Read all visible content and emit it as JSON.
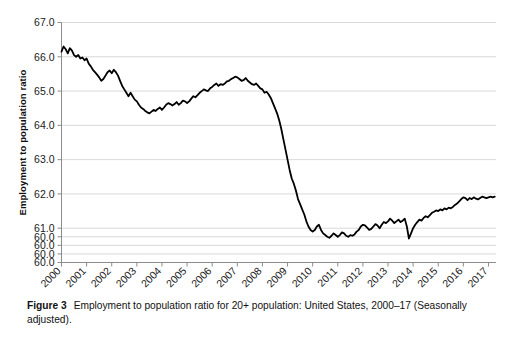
{
  "figure": {
    "caption_label": "Figure 3",
    "caption_text": "Employment to population ratio for 20+ population: United States, 2000–17 (Seasonally adjusted)."
  },
  "chart_data": {
    "type": "line",
    "title": "",
    "subtitle": "",
    "xlabel": "",
    "ylabel": "Employment to population ratio",
    "xlim": [
      2000.0,
      2017.3
    ],
    "ylim": [
      60.0,
      67.0
    ],
    "grid": true,
    "grid_axis": "y",
    "legend": false,
    "legend_position": "none",
    "line_color": "#000000",
    "line_width": 1.8,
    "grid_color": "#d9d9d9",
    "axis_color": "#8c8c8c",
    "background_color": "#ffffff",
    "y_tick_labels": [
      "67.0",
      "66.0",
      "65.0",
      "64.0",
      "63.0",
      "62.0",
      "61.0",
      "60.0",
      "60.0",
      "60.0",
      "60.0"
    ],
    "y_tick_positions": [
      67.0,
      66.0,
      65.0,
      64.0,
      63.0,
      62.0,
      61.0,
      60.75,
      60.5,
      60.25,
      60.0
    ],
    "x_tick_labels": [
      "2000",
      "2001",
      "2002",
      "2003",
      "2004",
      "2005",
      "2006",
      "2007",
      "2008",
      "2009",
      "2010",
      "2011",
      "2012",
      "2013",
      "2014",
      "2015",
      "2016",
      "2017"
    ],
    "x_tick_positions": [
      2000,
      2001,
      2002,
      2003,
      2004,
      2005,
      2006,
      2007,
      2008,
      2009,
      2010,
      2011,
      2012,
      2013,
      2014,
      2015,
      2016,
      2017
    ],
    "x_tick_rotation": -45,
    "series": [
      {
        "name": "Employment to population ratio (20+)",
        "x": [
          2000.0,
          2000.083,
          2000.167,
          2000.25,
          2000.333,
          2000.417,
          2000.5,
          2000.583,
          2000.667,
          2000.75,
          2000.833,
          2000.917,
          2001.0,
          2001.083,
          2001.167,
          2001.25,
          2001.333,
          2001.417,
          2001.5,
          2001.583,
          2001.667,
          2001.75,
          2001.833,
          2001.917,
          2002.0,
          2002.083,
          2002.167,
          2002.25,
          2002.333,
          2002.417,
          2002.5,
          2002.583,
          2002.667,
          2002.75,
          2002.833,
          2002.917,
          2003.0,
          2003.083,
          2003.167,
          2003.25,
          2003.333,
          2003.417,
          2003.5,
          2003.583,
          2003.667,
          2003.75,
          2003.833,
          2003.917,
          2004.0,
          2004.083,
          2004.167,
          2004.25,
          2004.333,
          2004.417,
          2004.5,
          2004.583,
          2004.667,
          2004.75,
          2004.833,
          2004.917,
          2005.0,
          2005.083,
          2005.167,
          2005.25,
          2005.333,
          2005.417,
          2005.5,
          2005.583,
          2005.667,
          2005.75,
          2005.833,
          2005.917,
          2006.0,
          2006.083,
          2006.167,
          2006.25,
          2006.333,
          2006.417,
          2006.5,
          2006.583,
          2006.667,
          2006.75,
          2006.833,
          2006.917,
          2007.0,
          2007.083,
          2007.167,
          2007.25,
          2007.333,
          2007.417,
          2007.5,
          2007.583,
          2007.667,
          2007.75,
          2007.833,
          2007.917,
          2008.0,
          2008.083,
          2008.167,
          2008.25,
          2008.333,
          2008.417,
          2008.5,
          2008.583,
          2008.667,
          2008.75,
          2008.833,
          2008.917,
          2009.0,
          2009.083,
          2009.167,
          2009.25,
          2009.333,
          2009.417,
          2009.5,
          2009.583,
          2009.667,
          2009.75,
          2009.833,
          2009.917,
          2010.0,
          2010.083,
          2010.167,
          2010.25,
          2010.333,
          2010.417,
          2010.5,
          2010.583,
          2010.667,
          2010.75,
          2010.833,
          2010.917,
          2011.0,
          2011.083,
          2011.167,
          2011.25,
          2011.333,
          2011.417,
          2011.5,
          2011.583,
          2011.667,
          2011.75,
          2011.833,
          2011.917,
          2012.0,
          2012.083,
          2012.167,
          2012.25,
          2012.333,
          2012.417,
          2012.5,
          2012.583,
          2012.667,
          2012.75,
          2012.833,
          2012.917,
          2013.0,
          2013.083,
          2013.167,
          2013.25,
          2013.333,
          2013.417,
          2013.5,
          2013.583,
          2013.667,
          2013.75,
          2013.833,
          2013.917,
          2014.0,
          2014.083,
          2014.167,
          2014.25,
          2014.333,
          2014.417,
          2014.5,
          2014.583,
          2014.667,
          2014.75,
          2014.833,
          2014.917,
          2015.0,
          2015.083,
          2015.167,
          2015.25,
          2015.333,
          2015.417,
          2015.5,
          2015.583,
          2015.667,
          2015.75,
          2015.833,
          2015.917,
          2016.0,
          2016.083,
          2016.167,
          2016.25,
          2016.333,
          2016.417,
          2016.5,
          2016.583,
          2016.667,
          2016.75,
          2016.833,
          2016.917,
          2017.0,
          2017.083,
          2017.167,
          2017.25
        ],
        "values": [
          66.15,
          66.3,
          66.22,
          66.1,
          66.25,
          66.18,
          66.05,
          66.0,
          66.05,
          65.95,
          65.98,
          65.9,
          65.95,
          65.8,
          65.72,
          65.62,
          65.55,
          65.48,
          65.4,
          65.3,
          65.35,
          65.45,
          65.55,
          65.6,
          65.52,
          65.62,
          65.55,
          65.45,
          65.3,
          65.15,
          65.05,
          64.95,
          64.85,
          64.95,
          64.85,
          64.75,
          64.7,
          64.6,
          64.52,
          64.48,
          64.42,
          64.38,
          64.35,
          64.4,
          64.45,
          64.42,
          64.48,
          64.52,
          64.45,
          64.52,
          64.6,
          64.65,
          64.62,
          64.58,
          64.62,
          64.68,
          64.6,
          64.65,
          64.72,
          64.7,
          64.65,
          64.7,
          64.78,
          64.85,
          64.82,
          64.88,
          64.95,
          65.0,
          65.05,
          65.02,
          65.0,
          65.08,
          65.12,
          65.18,
          65.22,
          65.15,
          65.2,
          65.18,
          65.22,
          65.28,
          65.3,
          65.35,
          65.38,
          65.42,
          65.4,
          65.35,
          65.3,
          65.32,
          65.38,
          65.3,
          65.25,
          65.2,
          65.18,
          65.22,
          65.15,
          65.08,
          65.05,
          64.95,
          64.98,
          64.9,
          64.8,
          64.65,
          64.5,
          64.35,
          64.15,
          63.9,
          63.6,
          63.3,
          63.0,
          62.7,
          62.45,
          62.3,
          62.1,
          61.85,
          61.7,
          61.55,
          61.4,
          61.2,
          61.05,
          60.95,
          60.9,
          60.95,
          61.05,
          61.1,
          60.95,
          60.85,
          60.8,
          60.75,
          60.72,
          60.78,
          60.85,
          60.8,
          60.75,
          60.8,
          60.88,
          60.85,
          60.78,
          60.75,
          60.8,
          60.78,
          60.82,
          60.9,
          60.95,
          61.05,
          61.1,
          61.08,
          61.02,
          60.95,
          60.98,
          61.05,
          61.12,
          61.08,
          61.0,
          61.1,
          61.18,
          61.15,
          61.2,
          61.28,
          61.22,
          61.15,
          61.2,
          61.25,
          61.18,
          61.22,
          61.28,
          61.05,
          60.7,
          60.85,
          61.0,
          61.1,
          61.18,
          61.25,
          61.22,
          61.3,
          61.35,
          61.32,
          61.38,
          61.45,
          61.48,
          61.52,
          61.5,
          61.55,
          61.52,
          61.58,
          61.55,
          61.6,
          61.58,
          61.62,
          61.68,
          61.72,
          61.78,
          61.85,
          61.9,
          61.88,
          61.82,
          61.88,
          61.85,
          61.9,
          61.86,
          61.84,
          61.88,
          61.92,
          61.9,
          61.88,
          61.9,
          61.92,
          61.9,
          61.92
        ]
      }
    ]
  }
}
